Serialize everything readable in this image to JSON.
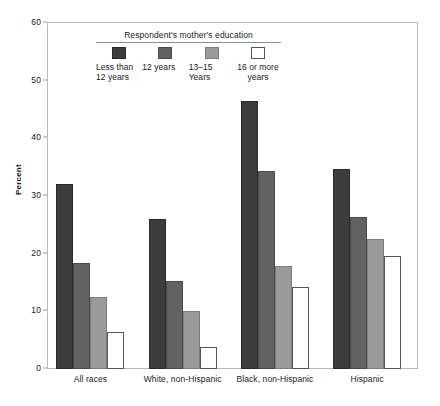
{
  "chart_data": {
    "type": "bar",
    "title": "",
    "xlabel": "",
    "ylabel": "Percent",
    "ylim": [
      0,
      60
    ],
    "yticks": [
      0,
      10,
      20,
      30,
      40,
      50,
      60
    ],
    "grid": false,
    "legend_position": "inside-top-left",
    "legend_title": "Respondent's mother's education",
    "categories": [
      "All races",
      "White, non-Hispanic",
      "Black, non-Hispanic",
      "Hispanic"
    ],
    "series": [
      {
        "name": "Less than 12 years",
        "color": "#3d3d3d",
        "values": [
          32.0,
          26.0,
          46.5,
          34.7
        ]
      },
      {
        "name": "12 years",
        "color": "#626262",
        "values": [
          18.4,
          15.2,
          34.3,
          26.3
        ]
      },
      {
        "name": "13–15 Years",
        "color": "#9a9a9a",
        "values": [
          12.5,
          10.0,
          17.8,
          22.6
        ]
      },
      {
        "name": "16 or more years",
        "color": "#ffffff",
        "values": [
          6.4,
          3.9,
          14.3,
          19.6
        ]
      }
    ]
  },
  "legend": {
    "title": "Respondent's mother's education",
    "items": [
      {
        "label_line1": "Less than",
        "label_line2": "12 years",
        "swatch": "swatch-dark"
      },
      {
        "label_line1": "12 years",
        "label_line2": "",
        "swatch": "swatch-medium"
      },
      {
        "label_line1": "13–15 Years",
        "label_line2": "",
        "swatch": "swatch-light"
      },
      {
        "label_line1": "16 or more",
        "label_line2": "years",
        "swatch": "swatch-white"
      }
    ]
  },
  "axes": {
    "y_title": "Percent",
    "y_tick_labels": [
      "60",
      "50",
      "40",
      "30",
      "20",
      "10",
      "0"
    ],
    "x_tick_labels": [
      "All races",
      "White, non-Hispanic",
      "Black, non-Hispanic",
      "Hispanic"
    ]
  }
}
